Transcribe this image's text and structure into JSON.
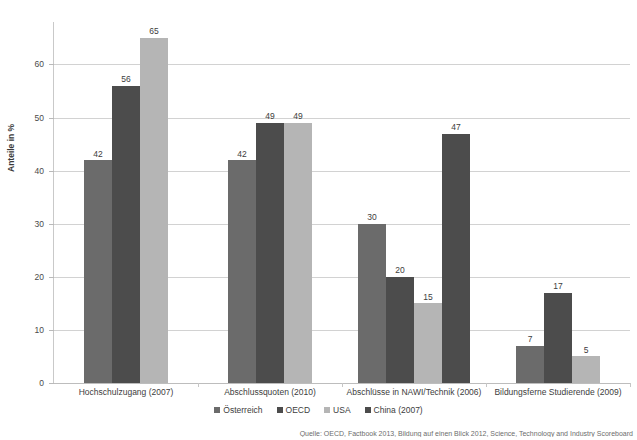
{
  "chart_data": {
    "type": "bar",
    "title": "",
    "subtitle": "",
    "xlabel": "",
    "ylabel": "Anteile in %",
    "ylim": [
      0,
      68
    ],
    "yticks": [
      0,
      10,
      20,
      30,
      40,
      50,
      60
    ],
    "ytick_labels": [
      "0",
      "10",
      "20",
      "30",
      "40",
      "50",
      "60"
    ],
    "grid": true,
    "legend_position": "bottom",
    "categories": [
      "Hochschulzugang (2007)",
      "Abschlussquoten (2010)",
      "Abschlüsse in NAWI/Technik (2006)",
      "Bildungsferne Studierende (2009)"
    ],
    "series": [
      {
        "name": "Österreich",
        "color": "#6b6b6b",
        "values": [
          42,
          42,
          30,
          7
        ]
      },
      {
        "name": "OECD",
        "color": "#4c4c4c",
        "values": [
          56,
          49,
          20,
          17
        ]
      },
      {
        "name": "USA",
        "color": "#b5b5b5",
        "values": [
          65,
          49,
          15,
          5
        ]
      },
      {
        "name": "China (2007)",
        "color": "#4c4c4c",
        "values": [
          null,
          null,
          47,
          null
        ]
      }
    ],
    "bar_labels": [
      [
        "42",
        "56",
        "65"
      ],
      [
        "42",
        "49",
        "49"
      ],
      [
        "30",
        "20",
        "15",
        "47"
      ],
      [
        "7",
        "17",
        "5"
      ]
    ],
    "colors": {
      "gridline": "#d2d2d2",
      "axis": "#c9c9c9",
      "text": "#3d3d3d",
      "background": "#ffffff"
    }
  },
  "legend": {
    "items": [
      {
        "label": "Österreich",
        "color": "#6b6b6b"
      },
      {
        "label": "OECD",
        "color": "#4c4c4c"
      },
      {
        "label": "USA",
        "color": "#b5b5b5"
      },
      {
        "label": "China (2007)",
        "color": "#4c4c4c"
      }
    ]
  },
  "source": {
    "text": "Quelle: OECD, Factbook 2013, Bildung auf einen Blick 2012, Science, Technology and Industry Scoreboard"
  }
}
